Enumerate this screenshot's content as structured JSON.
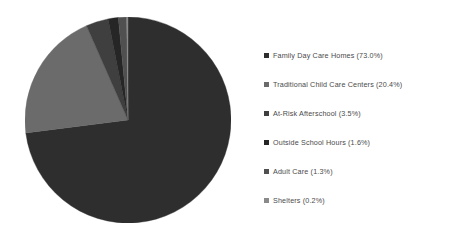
{
  "chart_data": {
    "type": "pie",
    "title": "",
    "legend_position": "right",
    "start_angle_deg": 0,
    "direction": "clockwise",
    "categories": [
      "Family Day Care Homes",
      "Traditional Child Care Centers",
      "At-Risk Afterschool",
      "Outside School Hours",
      "Adult Care",
      "Shelters"
    ],
    "values": [
      73.0,
      20.4,
      3.5,
      1.6,
      1.3,
      0.2
    ],
    "value_unit": "%",
    "colors": [
      "#2e2e2e",
      "#6b6b6b",
      "#3f3f3f",
      "#262626",
      "#505050",
      "#8a8a8a"
    ],
    "slices": [
      {
        "label": "Family Day Care Homes",
        "value": 73.0,
        "color": "#2e2e2e"
      },
      {
        "label": "Traditional Child Care Centers",
        "value": 20.4,
        "color": "#6b6b6b"
      },
      {
        "label": "At-Risk Afterschool",
        "value": 3.5,
        "color": "#3f3f3f"
      },
      {
        "label": "Outside School Hours",
        "value": 1.6,
        "color": "#262626"
      },
      {
        "label": "Adult Care",
        "value": 1.3,
        "color": "#505050"
      },
      {
        "label": "Shelters",
        "value": 0.2,
        "color": "#8a8a8a"
      }
    ]
  },
  "legend": {
    "items": [
      {
        "label": "Family Day Care Homes (73.0%)",
        "color": "#2e2e2e"
      },
      {
        "label": "Traditional Child Care Centers (20.4%)",
        "color": "#6b6b6b"
      },
      {
        "label": "At-Risk Afterschool (3.5%)",
        "color": "#3f3f3f"
      },
      {
        "label": "Outside School Hours (1.6%)",
        "color": "#262626"
      },
      {
        "label": "Adult Care (1.3%)",
        "color": "#505050"
      },
      {
        "label": "Shelters (0.2%)",
        "color": "#8a8a8a"
      }
    ]
  }
}
